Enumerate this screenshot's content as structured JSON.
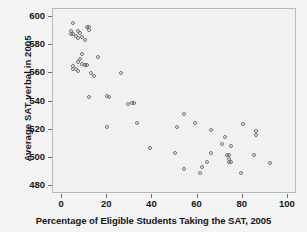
{
  "chart_data": {
    "type": "scatter",
    "title": "",
    "xlabel": "Percentage of Eligible Students Taking the SAT, 2005",
    "ylabel": "Average SAT verbal in 2005",
    "xlim": [
      -4,
      104
    ],
    "ylim": [
      474,
      606
    ],
    "xticks": [
      0,
      20,
      40,
      60,
      80,
      100
    ],
    "yticks": [
      480,
      500,
      520,
      540,
      560,
      580,
      600
    ],
    "grid": false,
    "legend": null,
    "marker": "open-circle",
    "marker_color": "#6e7275",
    "points": [
      {
        "x": 5,
        "y": 596
      },
      {
        "x": 4,
        "y": 590
      },
      {
        "x": 4,
        "y": 588
      },
      {
        "x": 5,
        "y": 588
      },
      {
        "x": 6,
        "y": 587
      },
      {
        "x": 7,
        "y": 590
      },
      {
        "x": 8,
        "y": 589
      },
      {
        "x": 7,
        "y": 585
      },
      {
        "x": 9,
        "y": 586
      },
      {
        "x": 11,
        "y": 593
      },
      {
        "x": 12,
        "y": 593
      },
      {
        "x": 12,
        "y": 591
      },
      {
        "x": 10,
        "y": 584
      },
      {
        "x": 5,
        "y": 565
      },
      {
        "x": 5,
        "y": 563
      },
      {
        "x": 6,
        "y": 563
      },
      {
        "x": 7,
        "y": 562
      },
      {
        "x": 7,
        "y": 568
      },
      {
        "x": 8,
        "y": 570
      },
      {
        "x": 9,
        "y": 574
      },
      {
        "x": 9,
        "y": 567
      },
      {
        "x": 10,
        "y": 566
      },
      {
        "x": 10,
        "y": 566
      },
      {
        "x": 11,
        "y": 566
      },
      {
        "x": 13,
        "y": 560
      },
      {
        "x": 14,
        "y": 558
      },
      {
        "x": 16,
        "y": 572
      },
      {
        "x": 12,
        "y": 543
      },
      {
        "x": 20,
        "y": 544
      },
      {
        "x": 21,
        "y": 543
      },
      {
        "x": 20,
        "y": 522
      },
      {
        "x": 26,
        "y": 560
      },
      {
        "x": 29,
        "y": 538
      },
      {
        "x": 31,
        "y": 539
      },
      {
        "x": 32,
        "y": 539
      },
      {
        "x": 33,
        "y": 525
      },
      {
        "x": 39,
        "y": 507
      },
      {
        "x": 50,
        "y": 503
      },
      {
        "x": 51,
        "y": 522
      },
      {
        "x": 54,
        "y": 531
      },
      {
        "x": 54,
        "y": 492
      },
      {
        "x": 59,
        "y": 525
      },
      {
        "x": 61,
        "y": 489
      },
      {
        "x": 62,
        "y": 493
      },
      {
        "x": 64,
        "y": 497
      },
      {
        "x": 66,
        "y": 503
      },
      {
        "x": 66,
        "y": 520
      },
      {
        "x": 71,
        "y": 510
      },
      {
        "x": 72,
        "y": 515
      },
      {
        "x": 73,
        "y": 502
      },
      {
        "x": 74,
        "y": 502
      },
      {
        "x": 74,
        "y": 499
      },
      {
        "x": 74,
        "y": 497
      },
      {
        "x": 75,
        "y": 497
      },
      {
        "x": 75,
        "y": 508
      },
      {
        "x": 79,
        "y": 489
      },
      {
        "x": 80,
        "y": 524
      },
      {
        "x": 85,
        "y": 502
      },
      {
        "x": 86,
        "y": 519
      },
      {
        "x": 86,
        "y": 516
      },
      {
        "x": 92,
        "y": 496
      }
    ]
  }
}
